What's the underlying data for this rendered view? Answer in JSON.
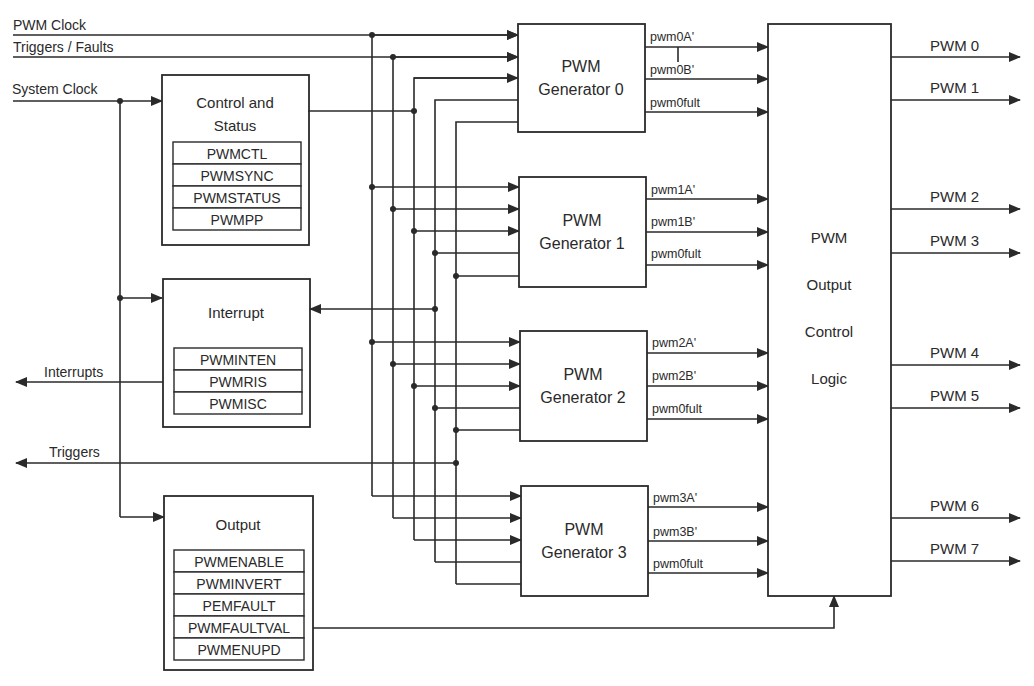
{
  "inputs": {
    "pwm_clock": "PWM Clock",
    "triggers_faults": "Triggers / Faults",
    "system_clock": "System Clock"
  },
  "left_outputs": {
    "interrupts": "Interrupts",
    "triggers": "Triggers"
  },
  "blocks": {
    "control_status": {
      "title_line1": "Control and",
      "title_line2": "Status",
      "registers": [
        "PWMCTL",
        "PWMSYNC",
        "PWMSTATUS",
        "PWMPP"
      ]
    },
    "interrupt": {
      "title": "Interrupt",
      "registers": [
        "PWMINTEN",
        "PWMRIS",
        "PWMISC"
      ]
    },
    "output": {
      "title": "Output",
      "registers": [
        "PWMENABLE",
        "PWMINVERT",
        "PEMFAULT",
        "PWMFAULTVAL",
        "PWMENUPD"
      ]
    }
  },
  "generators": [
    {
      "line1": "PWM",
      "line2": "Generator 0",
      "sig_a": "pwm0A'",
      "sig_b": "pwm0B'",
      "sig_fault": "pwm0fult"
    },
    {
      "line1": "PWM",
      "line2": "Generator 1",
      "sig_a": "pwm1A'",
      "sig_b": "pwm1B'",
      "sig_fault": "pwm0fult"
    },
    {
      "line1": "PWM",
      "line2": "Generator 2",
      "sig_a": "pwm2A'",
      "sig_b": "pwm2B'",
      "sig_fault": "pwm0fult"
    },
    {
      "line1": "PWM",
      "line2": "Generator 3",
      "sig_a": "pwm3A'",
      "sig_b": "pwm3B'",
      "sig_fault": "pwm0fult"
    }
  ],
  "output_control": {
    "lines": [
      "PWM",
      "Output",
      "Control",
      "Logic"
    ]
  },
  "pwm_outputs": [
    "PWM 0",
    "PWM 1",
    "PWM 2",
    "PWM 3",
    "PWM 4",
    "PWM 5",
    "PWM 6",
    "PWM 7"
  ]
}
